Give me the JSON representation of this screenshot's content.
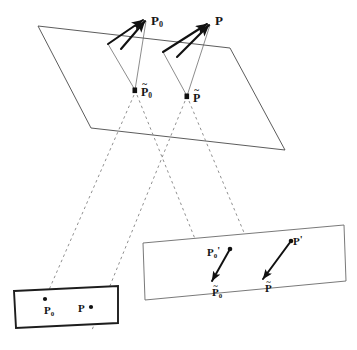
{
  "figure": {
    "stroke_color": "#444444",
    "dash_color": "#777777",
    "solid_color": "#111111"
  },
  "scene_points": [
    {
      "id": "P0",
      "base": "P",
      "sub": "0",
      "prime": "",
      "tilde": false,
      "x": 151,
      "y": 14
    },
    {
      "id": "P",
      "base": "P",
      "sub": "",
      "prime": "",
      "tilde": false,
      "x": 215,
      "y": 14
    }
  ],
  "plane_points": [
    {
      "id": "Ptilde0",
      "base": "P",
      "sub": "0",
      "prime": "",
      "tilde": true,
      "x": 141,
      "y": 86
    },
    {
      "id": "Ptilde",
      "base": "P",
      "sub": "",
      "prime": "",
      "tilde": true,
      "x": 193,
      "y": 92
    }
  ],
  "left_image_points": [
    {
      "id": "left-P0",
      "base": "P",
      "sub": "0",
      "prime": "",
      "tilde": false,
      "x": 44,
      "y": 305
    },
    {
      "id": "left-P",
      "base": "P",
      "sub": "",
      "prime": "",
      "tilde": false,
      "x": 78,
      "y": 303
    }
  ],
  "right_image_points": [
    {
      "id": "right-P0-prime",
      "base": "P",
      "sub": "0",
      "prime": "'",
      "tilde": false,
      "x": 207,
      "y": 246
    },
    {
      "id": "right-P-prime",
      "base": "P",
      "sub": "",
      "prime": "'",
      "tilde": false,
      "x": 293,
      "y": 235
    },
    {
      "id": "right-Ptilde0",
      "base": "P",
      "sub": "0",
      "prime": "",
      "tilde": true,
      "x": 212,
      "y": 287
    },
    {
      "id": "right-Ptilde",
      "base": "P",
      "sub": "",
      "prime": "",
      "tilde": true,
      "x": 265,
      "y": 283
    }
  ],
  "labels": {
    "plane_name": "scene plane",
    "left_rect_name": "left image rectangle",
    "right_rect_name": "right image plane"
  },
  "geometry": {
    "plane_polygon": "38,26 230,48 285,150 91,128",
    "left_rect_polygon": "14,291 118,286 118,323 16,328",
    "right_rect_polygon": "143,243 344,225 346,281 145,300"
  }
}
